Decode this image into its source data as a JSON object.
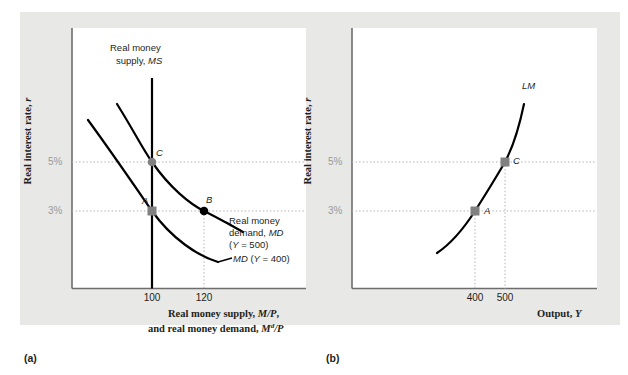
{
  "figure": {
    "background_color": "#ffffff",
    "band_color": "#e8e8e6",
    "plot_color": "#ffffff",
    "curve_color": "#000000",
    "gray_marker_color": "#808080",
    "black_marker_color": "#000000",
    "dotted_color": "#b0b0b0",
    "axis_color": "#6d6d6d"
  },
  "chart_data": [
    {
      "type": "line",
      "panel": "a",
      "title": "",
      "xlabel": "Real money supply, M/P, and real money demand, M^d/P",
      "ylabel": "Real interest rate, r",
      "xticks": [
        100,
        120
      ],
      "xtick_labels": [
        "100",
        "120"
      ],
      "yticks": [
        3,
        5
      ],
      "ytick_labels": [
        "3%",
        "5%"
      ],
      "grid": false,
      "legend_position": "inline-annotations",
      "series": [
        {
          "name": "Real money supply, MS",
          "kind": "vertical-line",
          "x": 100,
          "label": "Real money supply, MS"
        },
        {
          "name": "MD (Y = 400)",
          "kind": "downward-curve",
          "label": "MD (Y = 400)",
          "points": [
            [
              72,
              7.6
            ],
            [
              80,
              6.2
            ],
            [
              90,
              5.0
            ],
            [
              100,
              3.0
            ],
            [
              112,
              2.0
            ],
            [
              130,
              1.2
            ]
          ]
        },
        {
          "name": "Real money demand, MD (Y = 500)",
          "kind": "downward-curve",
          "label": "Real money demand, MD (Y = 500)",
          "points": [
            [
              88,
              8.2
            ],
            [
              96,
              6.8
            ],
            [
              105,
              5.0
            ],
            [
              120,
              3.0
            ],
            [
              133,
              2.2
            ]
          ]
        }
      ],
      "points": [
        {
          "id": "A",
          "label": "A",
          "x": 100,
          "y": 3,
          "marker": "gray-square"
        },
        {
          "id": "B",
          "label": "B",
          "x": 120,
          "y": 3,
          "marker": "black-circle"
        },
        {
          "id": "C",
          "label": "C",
          "x": 100,
          "y": 5,
          "marker": "gray-circle"
        }
      ]
    },
    {
      "type": "line",
      "panel": "b",
      "title": "",
      "xlabel": "Output, Y",
      "ylabel": "Real interest rate, r",
      "xticks": [
        400,
        500
      ],
      "xtick_labels": [
        "400",
        "500"
      ],
      "yticks": [
        3,
        5
      ],
      "ytick_labels": [
        "3%",
        "5%"
      ],
      "grid": false,
      "legend_position": "inline-annotations",
      "series": [
        {
          "name": "LM",
          "kind": "upward-curve",
          "label": "LM",
          "points": [
            [
              330,
              1.6
            ],
            [
              370,
              2.4
            ],
            [
              400,
              3.0
            ],
            [
              460,
              4.2
            ],
            [
              500,
              5.0
            ],
            [
              530,
              6.6
            ]
          ]
        }
      ],
      "points": [
        {
          "id": "A",
          "label": "A",
          "x": 400,
          "y": 3,
          "marker": "gray-square"
        },
        {
          "id": "C",
          "label": "C",
          "x": 500,
          "y": 5,
          "marker": "gray-square"
        }
      ]
    }
  ],
  "panel_a": {
    "y_axis_title_html": "Real interest rate, <i>r</i>",
    "x_axis_title_line1_html": "Real money supply, <i>M/P</i>,",
    "x_axis_title_line2_html": "and real money demand, <i>M<sup>d</sup>/P</i>",
    "ms_label_line1": "Real money",
    "ms_label_line2_html": "supply, <i>MS</i>",
    "md500_label_line1": "Real money",
    "md500_label_line2_html": "demand, <i>MD</i>",
    "md500_label_line3_html": "(<i>Y</i> = 500)",
    "md400_label_html": "<i>MD</i> (<i>Y</i> = 400)",
    "tick_100": "100",
    "tick_120": "120",
    "tick_5pct": "5%",
    "tick_3pct": "3%",
    "point_a": "A",
    "point_b": "B",
    "point_c": "C",
    "panel_letter": "(a)"
  },
  "panel_b": {
    "y_axis_title_html": "Real interest rate, <i>r</i>",
    "x_axis_title_html": "Output, <i>Y</i>",
    "lm_label": "LM",
    "tick_400": "400",
    "tick_500": "500",
    "tick_5pct": "5%",
    "tick_3pct": "3%",
    "point_a": "A",
    "point_c": "C",
    "panel_letter": "(b)"
  }
}
